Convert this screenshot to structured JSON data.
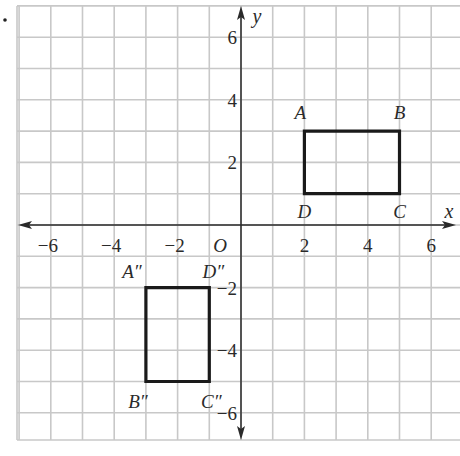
{
  "chart_data": {
    "type": "scatter",
    "title": "",
    "xlabel": "x",
    "ylabel": "y",
    "origin_label": "O",
    "xlim": [
      -7,
      7
    ],
    "ylim": [
      -7,
      7
    ],
    "grid": true,
    "x_ticks": [
      -6,
      -4,
      -2,
      2,
      4,
      6
    ],
    "y_ticks": [
      6,
      4,
      2,
      -2,
      -4,
      -6
    ],
    "x_tick_labels": [
      "−6",
      "−4",
      "−2",
      "2",
      "4",
      "6"
    ],
    "y_tick_labels": [
      "6",
      "4",
      "2",
      "−2",
      "−4",
      "−6"
    ],
    "series": [
      {
        "name": "ABCD",
        "shape": "rectangle",
        "points": [
          {
            "label": "A",
            "x": 2,
            "y": 3
          },
          {
            "label": "B",
            "x": 5,
            "y": 3
          },
          {
            "label": "C",
            "x": 5,
            "y": 1
          },
          {
            "label": "D",
            "x": 2,
            "y": 1
          }
        ]
      },
      {
        "name": "A''B''C''D''",
        "shape": "rectangle",
        "points": [
          {
            "label": "A″",
            "x": -3,
            "y": -2
          },
          {
            "label": "B″",
            "x": -3,
            "y": -5
          },
          {
            "label": "C″",
            "x": -1,
            "y": -5
          },
          {
            "label": "D″",
            "x": -1,
            "y": -2
          }
        ]
      }
    ]
  },
  "colors": {
    "grid": "#c8c8c8",
    "axis": "#2a2a2a",
    "shape": "#1a1a1a",
    "text": "#2a2a2a"
  }
}
